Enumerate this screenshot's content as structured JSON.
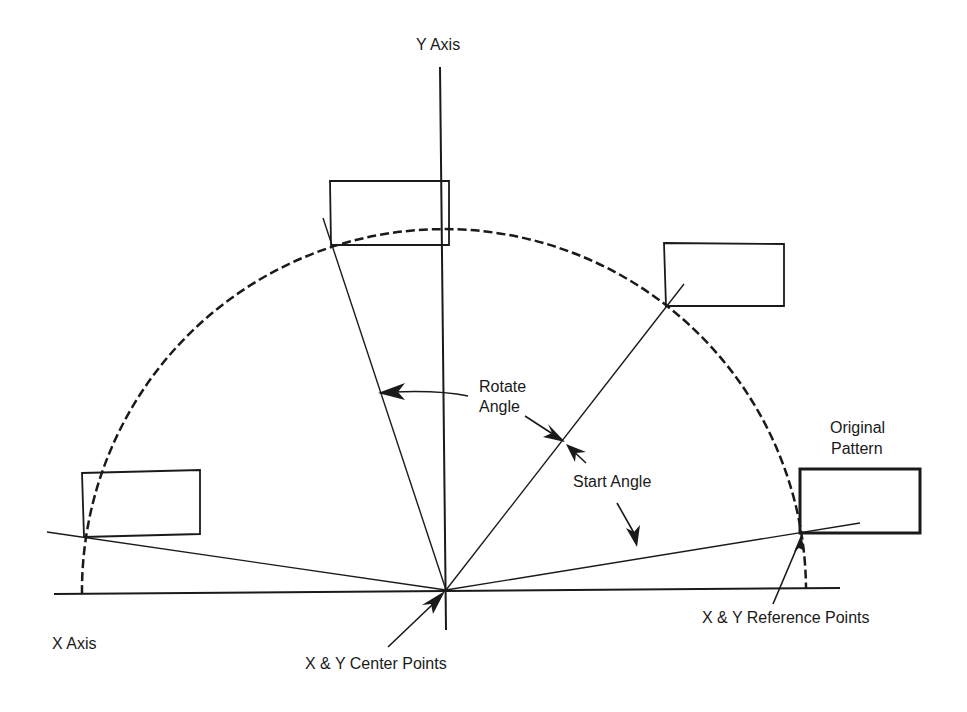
{
  "diagram": {
    "type": "geometry-rotation-pattern",
    "labels": {
      "y_axis": "Y Axis",
      "x_axis": "X Axis",
      "rotate_angle_line1": "Rotate",
      "rotate_angle_line2": "Angle",
      "start_angle": "Start Angle",
      "original_pattern_line1": "Original",
      "original_pattern_line2": "Pattern",
      "reference_points": "X & Y Reference Points",
      "center_points": "X & Y Center Points"
    },
    "colors": {
      "ink": "#1a1a1a",
      "background": "#ffffff"
    },
    "geometry": {
      "center": [
        446,
        590
      ],
      "arc_radius": 362,
      "pattern_copies": 4,
      "original_pattern_box": [
        800,
        469,
        920,
        533
      ]
    }
  }
}
